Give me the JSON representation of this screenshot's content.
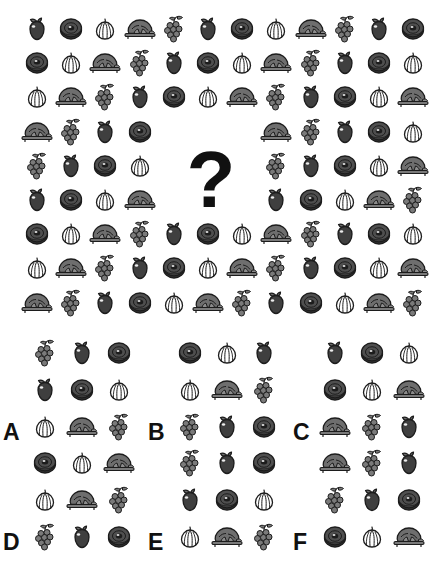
{
  "puzzle": {
    "type": "visual-sequence-matrix",
    "question_mark": "?",
    "icon_set": [
      "apple",
      "donut",
      "garlic",
      "turkey",
      "grapes"
    ],
    "icon_colors": {
      "apple": "#3f3f3f",
      "donut": "#4a4a4a",
      "garlic": "#ffffff",
      "turkey": "#6e6e6e",
      "grapes": "#7a7a7a",
      "outline": "#1c1c1c",
      "question_mark": "#111111",
      "background": "#ffffff"
    },
    "matrix": {
      "rows": 9,
      "cols": 12,
      "missing_block": {
        "start_row": 4,
        "start_col": 5,
        "rows": 3,
        "cols": 3
      },
      "cells": [
        [
          "apple",
          "donut",
          "garlic",
          "turkey",
          "grapes",
          "apple",
          "donut",
          "garlic",
          "turkey",
          "grapes",
          "apple",
          "donut"
        ],
        [
          "donut",
          "garlic",
          "turkey",
          "grapes",
          "apple",
          "donut",
          "garlic",
          "turkey",
          "grapes",
          "apple",
          "donut",
          "garlic"
        ],
        [
          "garlic",
          "turkey",
          "grapes",
          "apple",
          "donut",
          "garlic",
          "turkey",
          "grapes",
          "apple",
          "donut",
          "garlic",
          "turkey"
        ],
        [
          "turkey",
          "grapes",
          "apple",
          "donut",
          "",
          "",
          "",
          "turkey",
          "grapes",
          "apple",
          "donut",
          "garlic"
        ],
        [
          "grapes",
          "apple",
          "donut",
          "garlic",
          "",
          "",
          "",
          "grapes",
          "apple",
          "donut",
          "garlic",
          "turkey"
        ],
        [
          "apple",
          "donut",
          "garlic",
          "turkey",
          "",
          "",
          "",
          "apple",
          "donut",
          "garlic",
          "turkey",
          "grapes"
        ],
        [
          "donut",
          "garlic",
          "turkey",
          "grapes",
          "apple",
          "donut",
          "garlic",
          "turkey",
          "grapes",
          "apple",
          "donut",
          "garlic"
        ],
        [
          "garlic",
          "turkey",
          "grapes",
          "apple",
          "donut",
          "garlic",
          "turkey",
          "grapes",
          "apple",
          "donut",
          "garlic",
          "turkey"
        ],
        [
          "turkey",
          "grapes",
          "apple",
          "donut",
          "garlic",
          "turkey",
          "grapes",
          "apple",
          "donut",
          "garlic",
          "turkey",
          "grapes"
        ]
      ]
    },
    "options": [
      {
        "letter": "A",
        "cells": [
          [
            "grapes",
            "apple",
            "donut"
          ],
          [
            "apple",
            "donut",
            "garlic"
          ],
          [
            "garlic",
            "turkey",
            "grapes"
          ]
        ]
      },
      {
        "letter": "B",
        "cells": [
          [
            "donut",
            "garlic",
            "apple"
          ],
          [
            "garlic",
            "turkey",
            "grapes"
          ],
          [
            "grapes",
            "apple",
            "donut"
          ]
        ]
      },
      {
        "letter": "C",
        "cells": [
          [
            "apple",
            "donut",
            "garlic"
          ],
          [
            "donut",
            "garlic",
            "turkey"
          ],
          [
            "turkey",
            "grapes",
            "apple"
          ]
        ]
      },
      {
        "letter": "D",
        "cells": [
          [
            "donut",
            "garlic",
            "turkey"
          ],
          [
            "garlic",
            "turkey",
            "grapes"
          ],
          [
            "grapes",
            "apple",
            "donut"
          ]
        ]
      },
      {
        "letter": "E",
        "cells": [
          [
            "grapes",
            "apple",
            "donut"
          ],
          [
            "apple",
            "donut",
            "garlic"
          ],
          [
            "garlic",
            "turkey",
            "grapes"
          ]
        ]
      },
      {
        "letter": "F",
        "cells": [
          [
            "turkey",
            "grapes",
            "apple"
          ],
          [
            "grapes",
            "apple",
            "donut"
          ],
          [
            "donut",
            "garlic",
            "turkey"
          ]
        ]
      }
    ]
  }
}
